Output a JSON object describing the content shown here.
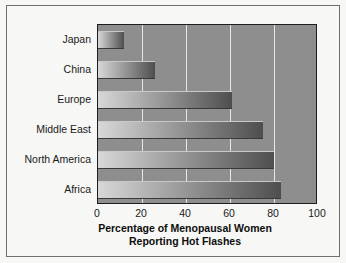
{
  "chart_data": {
    "type": "bar",
    "orientation": "horizontal",
    "title": "",
    "xlabel": "Percentage of Menopausal Women Reporting Hot Flashes",
    "xlabel_line1": "Percentage of Menopausal Women",
    "xlabel_line2": "Reporting Hot Flashes",
    "ylabel": "",
    "categories": [
      "Japan",
      "China",
      "Europe",
      "Middle East",
      "North America",
      "Africa"
    ],
    "values": [
      12,
      26,
      61,
      75,
      80,
      83
    ],
    "xlim": [
      0,
      100
    ],
    "xticks": [
      0,
      20,
      40,
      60,
      80,
      100
    ],
    "xtick_labels": [
      "0",
      "20",
      "40",
      "60",
      "80",
      "100"
    ],
    "grid": "vertical-only",
    "legend": "none",
    "colors": {
      "plot_background": "#8e8e8e",
      "figure_background": "#f7f7f5",
      "gridline": "#e8e8e8",
      "axis_line": "#1d1d1d",
      "frame_border": "#6e6e6e",
      "bar_gradient_light": "#d8d8d8",
      "bar_gradient_dark": "#4e4e4e",
      "text": "#1a1a1a"
    }
  }
}
